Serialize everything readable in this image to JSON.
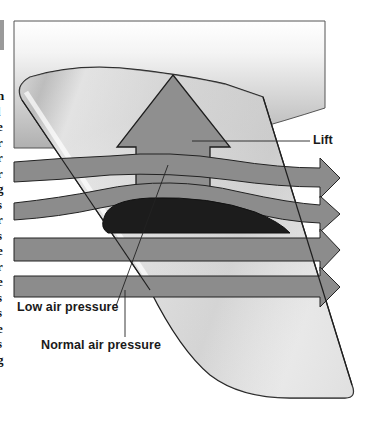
{
  "figure": {
    "labels": {
      "lift": "Lift",
      "low_pressure": "Low air pressure",
      "normal_pressure": "Normal air pressure"
    },
    "elements": {
      "fuselage_panel": "fuselage-panel",
      "wing": "wing",
      "airfoil": "airfoil-cross-section",
      "lift_arrow": "lift-arrow",
      "airflow_arrows": [
        "airflow-arrow-1",
        "airflow-arrow-2",
        "airflow-arrow-3",
        "airflow-arrow-4"
      ]
    },
    "colors": {
      "arrow_fill": "#8c8c8c",
      "lift_arrow_fill": "#8f8f8f",
      "airfoil_fill": "#1c1c1c",
      "outline": "#222222",
      "panel_top": "#ffffff",
      "panel_bottom": "#b5b5b5",
      "wing_light": "#f2f2f2",
      "wing_mid": "#c9c9c9"
    }
  },
  "margin_text": {
    "cut_off_glyphs": [
      "n",
      "l",
      "e",
      "r",
      "r",
      "r",
      "g",
      "s",
      "r",
      "s",
      "e",
      "r",
      "e",
      "s",
      "s",
      "e",
      "s",
      "g"
    ]
  }
}
